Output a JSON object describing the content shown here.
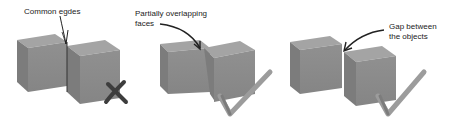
{
  "panels": [
    {
      "id": "common-edges",
      "label_lines": [
        "Common egdes"
      ],
      "verdict": "incorrect",
      "verdict_icon": "cross-icon"
    },
    {
      "id": "overlapping-faces",
      "label_lines": [
        "Partially overlapping",
        "faces"
      ],
      "verdict": "correct",
      "verdict_icon": "checkmark-icon"
    },
    {
      "id": "gap-between",
      "label_lines": [
        "Gap between",
        "the objects"
      ],
      "verdict": "correct",
      "verdict_icon": "checkmark-icon"
    }
  ],
  "colors": {
    "cube_front": "#8a8a8a",
    "cube_top": "#a2a2a2",
    "cube_side": "#7a7a7a",
    "cross": "#3f3f3f",
    "check": "#9a9a9a",
    "arrow": "#222222"
  }
}
